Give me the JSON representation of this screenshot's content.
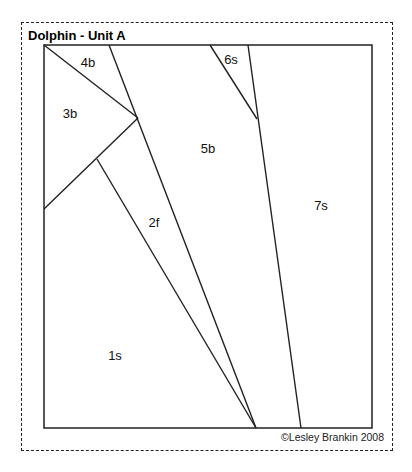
{
  "title": "Dolphin - Unit A",
  "copyright": "©Lesley Brankin 2008",
  "colors": {
    "line": "#222222",
    "background": "#ffffff"
  },
  "frame": {
    "outer_dashed": [
      21,
      22,
      393,
      451
    ],
    "inner_solid": [
      44,
      45,
      372,
      428
    ]
  },
  "pieces": [
    {
      "id": "1s",
      "label": "1s",
      "x": 115,
      "y": 355
    },
    {
      "id": "2f",
      "label": "2f",
      "x": 154,
      "y": 222
    },
    {
      "id": "3b",
      "label": "3b",
      "x": 70,
      "y": 113
    },
    {
      "id": "4b",
      "label": "4b",
      "x": 88,
      "y": 62
    },
    {
      "id": "5b",
      "label": "5b",
      "x": 208,
      "y": 148
    },
    {
      "id": "6s",
      "label": "6s",
      "x": 231,
      "y": 59
    },
    {
      "id": "7s",
      "label": "7s",
      "x": 321,
      "y": 205
    }
  ],
  "lines": [
    {
      "name": "line-4b-3b",
      "x1": 44,
      "y1": 45,
      "x2": 138,
      "y2": 118
    },
    {
      "name": "line-3b-1s",
      "x1": 44,
      "y1": 209,
      "x2": 138,
      "y2": 118
    },
    {
      "name": "line-5b-left",
      "x1": 109,
      "y1": 45,
      "x2": 256,
      "y2": 428
    },
    {
      "name": "line-2f-left",
      "x1": 97,
      "y1": 159,
      "x2": 256,
      "y2": 428
    },
    {
      "name": "line-6s-left",
      "x1": 210,
      "y1": 45,
      "x2": 257,
      "y2": 119
    },
    {
      "name": "line-7s-left",
      "x1": 248,
      "y1": 45,
      "x2": 301,
      "y2": 428
    }
  ]
}
